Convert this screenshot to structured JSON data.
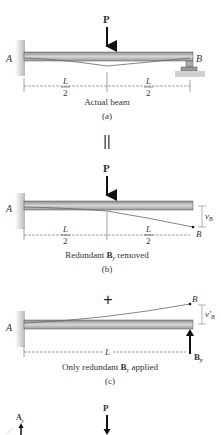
{
  "figure": {
    "panel_a": {
      "load_label": "P",
      "support_left": "A",
      "support_right": "B",
      "dim_left_num": "L",
      "dim_left_den": "2",
      "dim_right_num": "L",
      "dim_right_den": "2",
      "caption": "Actual beam",
      "tag": "(a)"
    },
    "equals_sign": "||",
    "panel_b": {
      "load_label": "P",
      "support_left": "A",
      "end_label": "B",
      "deflection_label": "v",
      "deflection_sub": "B",
      "dim_left_num": "L",
      "dim_left_den": "2",
      "dim_right_num": "L",
      "dim_right_den": "2",
      "caption_pre": "Redundant ",
      "caption_bold": "B",
      "caption_sub": "y",
      "caption_post": " removed",
      "tag": "(b)"
    },
    "plus_sign": "+",
    "panel_c": {
      "support_left": "A",
      "end_label": "B",
      "deflection_label": "v′",
      "deflection_sub": "B",
      "dim_label": "L",
      "force_label": "B",
      "force_sub": "y",
      "caption_pre": "Only redundant ",
      "caption_bold": "B",
      "caption_sub": "y",
      "caption_post": " applied",
      "tag": "(c)"
    },
    "panel_d_partial": {
      "load_label": "P",
      "reaction_label": "A",
      "reaction_sub": "y"
    }
  }
}
